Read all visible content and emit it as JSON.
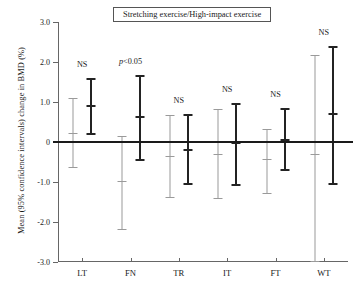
{
  "chart_data": {
    "type": "scatter",
    "title": "Stretching exercise/High-impact exercise",
    "xlabel": "",
    "ylabel": "Mean (95% confidence intervals) change in BMD (%)",
    "ylim": [
      -3.0,
      3.0
    ],
    "ytick_labels": [
      "3.0",
      "2.0",
      "1.0",
      "0",
      "-1.0",
      "-2.0",
      "-3.0"
    ],
    "ytick_values": [
      3.0,
      2.0,
      1.0,
      0,
      -1.0,
      -2.0,
      -3.0
    ],
    "grid": false,
    "legend_position": "top-center-box",
    "categories": [
      "LT",
      "FN",
      "TR",
      "IT",
      "FT",
      "WT"
    ],
    "annotations": [
      "NS",
      "p<0.05",
      "NS",
      "NS",
      "NS",
      "NS"
    ],
    "zero_reference_line": 0,
    "series": [
      {
        "name": "Stretching exercise",
        "color": "#9a9a9a",
        "mean": [
          0.22,
          -0.97,
          -0.35,
          -0.3,
          -0.43,
          -0.3
        ],
        "ci_lower": [
          -0.63,
          -2.18,
          -1.37,
          -1.39,
          -1.27,
          -2.97
        ],
        "ci_upper": [
          1.1,
          0.15,
          0.67,
          0.82,
          0.32,
          2.17
        ]
      },
      {
        "name": "High-impact exercise",
        "color": "#232323",
        "mean": [
          0.92,
          0.64,
          -0.18,
          0.0,
          0.07,
          0.72
        ],
        "ci_lower": [
          0.22,
          -0.42,
          -1.02,
          -1.05,
          -0.68,
          -1.02
        ],
        "ci_upper": [
          1.61,
          1.68,
          0.7,
          0.97,
          0.86,
          2.4
        ]
      }
    ]
  }
}
